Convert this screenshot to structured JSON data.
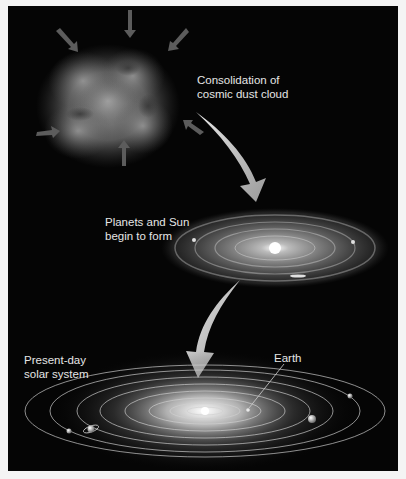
{
  "figure": {
    "stages": [
      {
        "id": "dust-cloud",
        "label_line1": "Consolidation of",
        "label_line2": "cosmic dust cloud"
      },
      {
        "id": "protoplanetary-disk",
        "label_line1": "Planets and Sun",
        "label_line2": "begin to form"
      },
      {
        "id": "solar-system",
        "label_line1": "Present-day",
        "label_line2": "solar system"
      }
    ],
    "earth_label": "Earth"
  },
  "colors": {
    "background": "#050505",
    "frame": "#f4f4f4",
    "text": "#e6e6e6",
    "arrow": "#bdbdbd",
    "orbit": "#d0d0d0"
  }
}
